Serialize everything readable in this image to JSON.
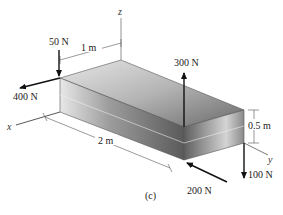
{
  "figure": {
    "caption": "(c)",
    "axes": {
      "x": "x",
      "y": "y",
      "z": "z"
    },
    "dimensions": {
      "width": "1 m",
      "length": "2 m",
      "height": "0.5 m"
    },
    "forces": [
      {
        "label": "50 N",
        "direction": "down",
        "location": "top-left corner"
      },
      {
        "label": "400 N",
        "direction": "along -y (left)",
        "location": "top-left corner"
      },
      {
        "label": "300 N",
        "direction": "up",
        "location": "top front corner"
      },
      {
        "label": "200 N",
        "direction": "along -y (into box)",
        "location": "bottom front corner"
      },
      {
        "label": "100 N",
        "direction": "down",
        "location": "right corner"
      }
    ],
    "colors": {
      "box_light": "#d8d8d8",
      "box_dark": "#6e6e6e",
      "arrow": "#111111",
      "dim_line": "#555555"
    }
  }
}
